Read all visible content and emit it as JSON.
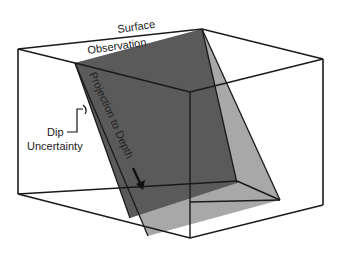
{
  "diagram": {
    "labels": {
      "surface_line1": "Surface",
      "surface_line2": "Observation",
      "projection": "Projection to Depth",
      "dip_line1": "Dip",
      "dip_line2": "Uncertainty"
    },
    "colors": {
      "background": "#ffffff",
      "edge": "#1a1a1a",
      "fault_plane": "#5a5a5a",
      "uncertainty_band": "#a8a8a8"
    }
  }
}
